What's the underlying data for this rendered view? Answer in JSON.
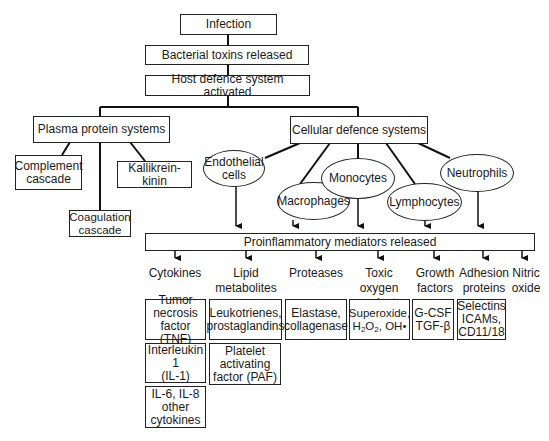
{
  "flow": {
    "infection": "Infection",
    "toxins": "Bacterial toxins released",
    "host_defence": "Host defence system activated"
  },
  "plasma": {
    "title": "Plasma protein systems",
    "children": {
      "complement": "Complement\ncascade",
      "kallikrein": "Kallikrein-kinin",
      "coagulation": "Coagulation\ncascade"
    }
  },
  "cellular": {
    "title": "Cellular defence systems",
    "cells": {
      "endothelial": "Endothelial\ncells",
      "macrophages": "Macrophages",
      "monocytes": "Monocytes",
      "lymphocytes": "Lymphocytes",
      "neutrophils": "Neutrophils"
    }
  },
  "mediators": {
    "title": "Proinflammatory mediators released",
    "categories": {
      "cytokines": "Cytokines",
      "lipid": "Lipid\nmetabolites",
      "proteases": "Proteases",
      "toxic": "Toxic oxygen\nproducts",
      "growth": "Growth\nfactors",
      "adhesion": "Adhesion\nproteins",
      "nitric": "Nitric\noxide"
    },
    "examples": {
      "tnf": "Tumor\nnecrosis\nfactor (TNF)",
      "il1": "Interleukin 1\n(IL-1)",
      "il6": "IL-6, IL-8\nother\ncytokines",
      "leuko": "Leukotrienes,\nprostaglandins",
      "paf": "Platelet\nactivating\nfactor (PAF)",
      "elastase": "Elastase,\ncollagenase",
      "superoxide_line1": "Superoxide,",
      "h2o2_h": "H",
      "h2o2_2a": "2",
      "h2o2_o": "O",
      "h2o2_2b": "2",
      "h2o2_rest": ", OH•",
      "growth_examples": "G-CSF\nTGF-β",
      "adhesion_examples": "Selectins\nICAMs,\nCD11/18"
    }
  }
}
